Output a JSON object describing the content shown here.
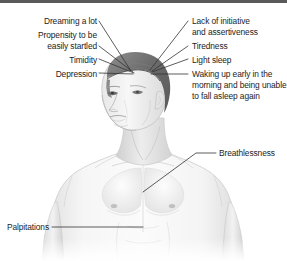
{
  "figure": {
    "style": "grayscale medical illustration with black leader lines",
    "colors": {
      "background": "#ffffff",
      "topbar": "#5a5a5a",
      "leader_line": "#333333",
      "text": "#1c1c1c",
      "skin_light": "#f2f2f2",
      "skin_mid": "#d8d8d8",
      "skin_shadow": "#b4b4b4",
      "hair_dark": "#6e6e6e",
      "hair_light": "#9a9a9a"
    }
  },
  "labels": {
    "left": [
      {
        "id": "dreaming",
        "text": "Dreaming a lot"
      },
      {
        "id": "startled_line1",
        "text": "Propensity to be"
      },
      {
        "id": "startled_line2",
        "text": "easily startled"
      },
      {
        "id": "timidity",
        "text": "Timidity"
      },
      {
        "id": "depression",
        "text": "Depression"
      },
      {
        "id": "palpitations",
        "text": "Palpitations"
      }
    ],
    "right": [
      {
        "id": "initiative_line1",
        "text": "Lack of initiative"
      },
      {
        "id": "initiative_line2",
        "text": "and assertiveness"
      },
      {
        "id": "tiredness",
        "text": "Tiredness"
      },
      {
        "id": "light_sleep",
        "text": "Light sleep"
      },
      {
        "id": "waking_line1",
        "text": "Waking up early in the"
      },
      {
        "id": "waking_line2",
        "text": "morning and being unable"
      },
      {
        "id": "waking_line3",
        "text": "to fall asleep again"
      },
      {
        "id": "breathlessness",
        "text": "Breathlessness"
      }
    ]
  }
}
